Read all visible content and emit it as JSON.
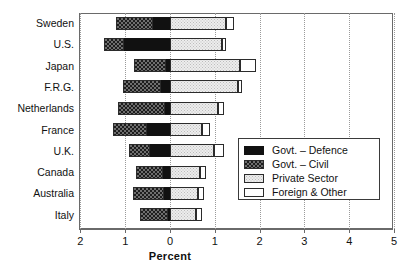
{
  "chart_data": {
    "type": "bar",
    "title": "",
    "subtitle": "",
    "xlabel": "Percent",
    "ylabel": "",
    "orientation": "horizontal",
    "stacked": true,
    "diverging": true,
    "note": "Horizontal diverging stacked bars. Axis runs 2,1,0 to the left of the zero line and 1,2,3,4,5 to the right. Government segments extend left (negative direction), Private Sector and Foreign & Other extend right.",
    "xlim": [
      -2,
      5
    ],
    "xticks": [
      -2,
      -1,
      0,
      1,
      2,
      3,
      4,
      5
    ],
    "xticklabels": [
      "2",
      "1",
      "0",
      "1",
      "2",
      "3",
      "4",
      "5"
    ],
    "grid": "vertical dotted gridlines at each tick",
    "legend_position": "inside lower right",
    "categories": [
      "Sweden",
      "U.S.",
      "Japan",
      "F.R.G.",
      "Netherlands",
      "France",
      "U.K.",
      "Canada",
      "Australia",
      "Italy"
    ],
    "series": [
      {
        "name": "Govt. - Defence",
        "color": "#111111",
        "direction": "left",
        "values": [
          0.38,
          1.03,
          0.09,
          0.2,
          0.11,
          0.51,
          0.45,
          0.16,
          0.13,
          0.04
        ]
      },
      {
        "name": "Govt. - Civil",
        "color": "#6e6e6e",
        "direction": "left",
        "values": [
          0.83,
          0.45,
          0.71,
          0.85,
          1.05,
          0.76,
          0.47,
          0.6,
          0.69,
          0.62
        ]
      },
      {
        "name": "Private Sector",
        "color": "#ededed",
        "direction": "right",
        "values": [
          1.25,
          1.16,
          1.56,
          1.52,
          1.07,
          0.71,
          0.98,
          0.67,
          0.63,
          0.58
        ]
      },
      {
        "name": "Foreign & Other",
        "color": "#ffffff",
        "direction": "right",
        "values": [
          0.18,
          0.09,
          0.36,
          0.09,
          0.13,
          0.18,
          0.22,
          0.13,
          0.13,
          0.13
        ]
      }
    ],
    "totals": [
      2.64,
      2.73,
      2.72,
      2.66,
      2.36,
      2.16,
      2.12,
      1.56,
      1.58,
      1.37
    ]
  },
  "axis": {
    "xlabel": "Percent",
    "ticklabels": [
      "2",
      "1",
      "0",
      "1",
      "2",
      "3",
      "4",
      "5"
    ]
  },
  "ylabels": [
    "Sweden",
    "U.S.",
    "Japan",
    "F.R.G.",
    "Netherlands",
    "France",
    "U.K.",
    "Canada",
    "Australia",
    "Italy"
  ],
  "legend": {
    "items": [
      {
        "label": "Govt. – Defence",
        "key": "defence"
      },
      {
        "label": "Govt. – Civil",
        "key": "civil"
      },
      {
        "label": "Private Sector",
        "key": "private"
      },
      {
        "label": "Foreign & Other",
        "key": "foreign"
      }
    ]
  }
}
